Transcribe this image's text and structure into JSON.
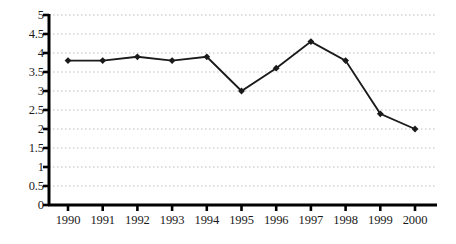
{
  "chart_data": {
    "type": "line",
    "title": "",
    "subtitle": "",
    "xlabel": "",
    "ylabel": "",
    "categories": [
      "1990",
      "1991",
      "1992",
      "1993",
      "1994",
      "1995",
      "1996",
      "1997",
      "1998",
      "1999",
      "2000"
    ],
    "values": [
      3.8,
      3.8,
      3.9,
      3.8,
      3.9,
      3.0,
      3.6,
      4.3,
      3.8,
      2.4,
      2.0
    ],
    "series": [
      {
        "name": "",
        "values": [
          3.8,
          3.8,
          3.9,
          3.8,
          3.9,
          3.0,
          3.6,
          4.3,
          3.8,
          2.4,
          2.0
        ]
      }
    ],
    "ylim": [
      0,
      5
    ],
    "y_ticks": [
      0,
      0.5,
      1,
      1.5,
      2,
      2.5,
      3,
      3.5,
      4,
      4.5,
      5
    ],
    "y_tick_labels": [
      "0",
      "0.5",
      "1",
      "1.5",
      "2",
      "2.5",
      "3",
      "3.5",
      "4",
      "4.5",
      "5"
    ],
    "x_tick_labels": [
      "1990",
      "1991",
      "1992",
      "1993",
      "1994",
      "1995",
      "1996",
      "1997",
      "1998",
      "1999",
      "2000"
    ],
    "grid": true,
    "grid_axis": "y",
    "grid_style": "dotted",
    "legend": false,
    "legend_position": "none",
    "marker": "diamond",
    "annotations": []
  },
  "style": {
    "background_color": "#ffffff",
    "line_color": "#1a1a1a",
    "marker_color": "#1a1a1a",
    "axis_color": "#000000",
    "grid_color": "#bfbfbf",
    "label_color": "#1a1a1a"
  }
}
